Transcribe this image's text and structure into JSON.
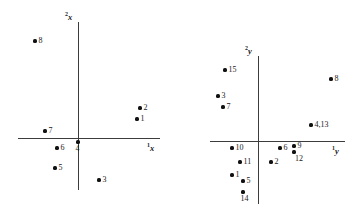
{
  "figure": {
    "background": "#ffffff",
    "point_color": "#111111",
    "axis_color": "#3c3c3c"
  },
  "chart_data": [
    {
      "type": "scatter",
      "title": "",
      "panel": "left",
      "xlabel": "1x",
      "ylabel": "2x",
      "xlabel_display": "x",
      "xlabel_sup": "1",
      "ylabel_display": "x",
      "ylabel_sup": "2",
      "grid": false,
      "legend": "none",
      "axes": {
        "origin_px": [
          78,
          138
        ],
        "x_axis_px": [
          18,
          160
        ],
        "y_axis_px": [
          22,
          190
        ],
        "xlim": [
          -1.05,
          1.45
        ],
        "ylim": [
          -0.95,
          2.05
        ]
      },
      "points": [
        {
          "label": "8",
          "px": [
            35,
            41
          ],
          "x": -0.76,
          "y": 1.74,
          "label_pos": "right"
        },
        {
          "label": "2",
          "px": [
            140,
            108
          ],
          "x": 1.08,
          "y": 0.53,
          "label_pos": "right"
        },
        {
          "label": "1",
          "px": [
            137,
            119
          ],
          "x": 1.03,
          "y": 0.33,
          "label_pos": "right"
        },
        {
          "label": "7",
          "px": [
            45,
            131
          ],
          "x": -0.58,
          "y": 0.12,
          "label_pos": "right"
        },
        {
          "label": "6",
          "px": [
            57,
            148
          ],
          "x": -0.37,
          "y": -0.18,
          "label_pos": "right"
        },
        {
          "label": "4",
          "px": [
            78,
            142
          ],
          "x": 0.0,
          "y": -0.07,
          "label_pos": "below"
        },
        {
          "label": "5",
          "px": [
            55,
            168
          ],
          "x": -0.4,
          "y": -0.53,
          "label_pos": "right"
        },
        {
          "label": "3",
          "px": [
            99,
            180
          ],
          "x": 0.37,
          "y": -0.74,
          "label_pos": "right"
        }
      ]
    },
    {
      "type": "scatter",
      "title": "",
      "panel": "right",
      "xlabel": "1y",
      "ylabel": "2y",
      "xlabel_display": "y",
      "xlabel_sup": "1",
      "ylabel_display": "y",
      "ylabel_sup": "2",
      "grid": false,
      "legend": "none",
      "axes": {
        "origin_px": [
          258,
          141
        ],
        "x_axis_px": [
          210,
          345
        ],
        "y_axis_px": [
          56,
          204
        ],
        "xlim": [
          -1.0,
          1.85
        ],
        "ylim": [
          -1.4,
          1.8
        ]
      },
      "points": [
        {
          "label": "15",
          "px": [
            225,
            70
          ],
          "x": -0.69,
          "y": 1.49,
          "label_pos": "right"
        },
        {
          "label": "8",
          "px": [
            331,
            79
          ],
          "x": 1.52,
          "y": 1.29,
          "label_pos": "right"
        },
        {
          "label": "3",
          "px": [
            218,
            96
          ],
          "x": -0.83,
          "y": 0.95,
          "label_pos": "right"
        },
        {
          "label": "7",
          "px": [
            223,
            107
          ],
          "x": -0.73,
          "y": 0.71,
          "label_pos": "right"
        },
        {
          "label": "4,13",
          "px": [
            311,
            125
          ],
          "x": 1.1,
          "y": 0.34,
          "label_pos": "right"
        },
        {
          "label": "10",
          "px": [
            232,
            148
          ],
          "x": -0.54,
          "y": -0.15,
          "label_pos": "right"
        },
        {
          "label": "6",
          "px": [
            280,
            148
          ],
          "x": 0.46,
          "y": -0.15,
          "label_pos": "right"
        },
        {
          "label": "9",
          "px": [
            294,
            146
          ],
          "x": 0.75,
          "y": -0.11,
          "label_pos": "right"
        },
        {
          "label": "12",
          "px": [
            294,
            152
          ],
          "x": 0.75,
          "y": -0.23,
          "label_pos": "belowr"
        },
        {
          "label": "11",
          "px": [
            240,
            162
          ],
          "x": -0.38,
          "y": -0.45,
          "label_pos": "right"
        },
        {
          "label": "2",
          "px": [
            271,
            162
          ],
          "x": 0.27,
          "y": -0.45,
          "label_pos": "right"
        },
        {
          "label": "1",
          "px": [
            232,
            175
          ],
          "x": -0.54,
          "y": -0.72,
          "label_pos": "right"
        },
        {
          "label": "5",
          "px": [
            243,
            181
          ],
          "x": -0.31,
          "y": -0.84,
          "label_pos": "right"
        },
        {
          "label": "14",
          "px": [
            243,
            192
          ],
          "x": -0.31,
          "y": -1.07,
          "label_pos": "below"
        }
      ]
    }
  ]
}
